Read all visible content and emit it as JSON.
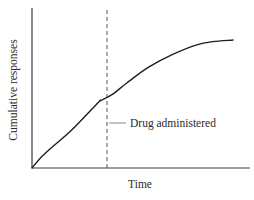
{
  "chart_data": {
    "type": "line",
    "title": "",
    "xlabel": "Time",
    "ylabel": "Cumulative responses",
    "grid": false,
    "legend": null,
    "x_ticks": [],
    "y_ticks": [],
    "xlim": [
      0,
      1
    ],
    "ylim": [
      0,
      1
    ],
    "series": [
      {
        "name": "Cumulative responses",
        "color": "#1e1e1e",
        "x": [
          0.0,
          0.04,
          0.1,
          0.2,
          0.33,
          0.34,
          0.4,
          0.47,
          0.58,
          0.7,
          0.82,
          0.9,
          1.0
        ],
        "y": [
          0.0,
          0.06,
          0.13,
          0.24,
          0.41,
          0.42,
          0.46,
          0.53,
          0.63,
          0.71,
          0.77,
          0.79,
          0.8
        ]
      }
    ],
    "annotations": [
      {
        "type": "vertical-dashed-line",
        "x": 0.34,
        "label": "Drug administered",
        "color": "#555555"
      }
    ]
  },
  "labels": {
    "x_axis": "Time",
    "y_axis": "Cumulative responses",
    "annotation": "Drug administered"
  },
  "colors": {
    "curve": "#1e1e1e",
    "axes": "#3a3a3a",
    "marker": "#555555",
    "leader": "#9a9a9a",
    "text": "#2a2a2a"
  }
}
